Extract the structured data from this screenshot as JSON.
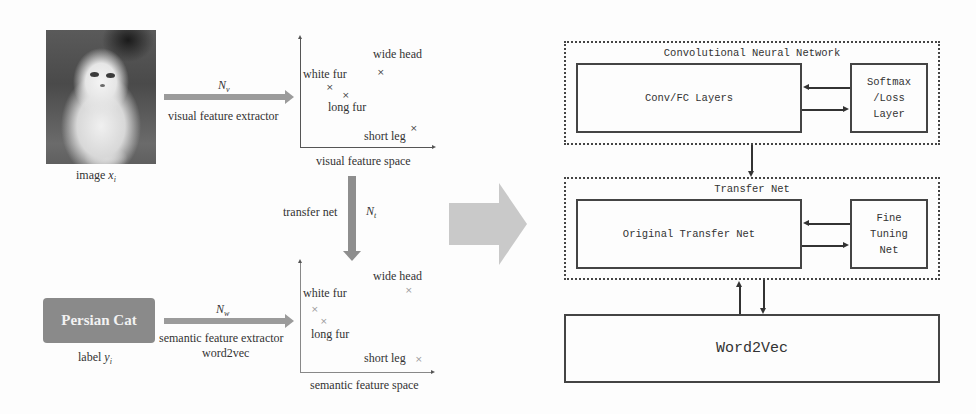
{
  "left_panel": {
    "image": {
      "caption_prefix": "image ",
      "caption_var": "x",
      "caption_sub": "i",
      "icon": "cat-photo"
    },
    "visual_arrow": {
      "symbol": "N",
      "symbol_sub": "v",
      "label": "visual feature extractor"
    },
    "visual_plot": {
      "title": "visual feature space",
      "points": [
        {
          "label": "wide head",
          "marker": "×"
        },
        {
          "label": "white fur",
          "marker": "×"
        },
        {
          "label": "long fur",
          "marker": "×"
        },
        {
          "label": "short leg",
          "marker": "×"
        }
      ]
    },
    "transfer_arrow": {
      "label": "transfer net",
      "symbol": "N",
      "symbol_sub": "t"
    },
    "semantic_plot": {
      "title": "semantic feature space",
      "points": [
        {
          "label": "wide head",
          "marker": "×"
        },
        {
          "label": "white fur",
          "marker": "×"
        },
        {
          "label": "long fur",
          "marker": "×"
        },
        {
          "label": "short leg",
          "marker": "×"
        }
      ]
    },
    "label_box": {
      "text": "Persian Cat",
      "caption_prefix": "label ",
      "caption_var": "y",
      "caption_sub": "i"
    },
    "semantic_arrow": {
      "symbol": "N",
      "symbol_sub": "w",
      "label_line1": "semantic feature extractor",
      "label_line2": "word2vec"
    }
  },
  "right_panel": {
    "cnn": {
      "title": "Convolutional Neural Network",
      "main_block": "Conv/FC Layers",
      "side_block": "Softmax\n/Loss\nLayer"
    },
    "transfer_net": {
      "title": "Transfer Net",
      "main_block": "Original Transfer Net",
      "side_block": "Fine\nTuning\nNet"
    },
    "word2vec": {
      "label": "Word2Vec"
    }
  },
  "colors": {
    "arrow_gray": "#9b9b9b",
    "big_arrow_gray": "#c9c9c9",
    "label_box_gray": "#8a8a8a",
    "line": "#444444"
  }
}
